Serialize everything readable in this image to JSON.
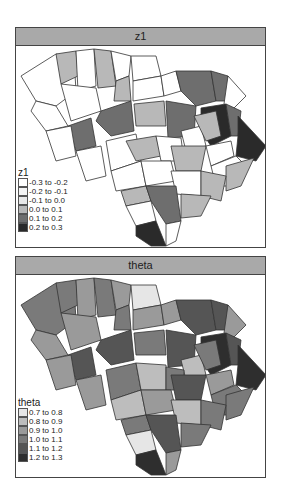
{
  "panels": [
    {
      "title": "z1",
      "legend": {
        "title": "z1",
        "items": [
          {
            "label": "-0.3 to -0.2",
            "color": "#ffffff"
          },
          {
            "label": "-0.2 to -0.1",
            "color": "#f4f4f4"
          },
          {
            "label": "-0.1 to 0.0",
            "color": "#e8e8e8"
          },
          {
            "label": "0.0 to 0.1",
            "color": "#b8b8b8"
          },
          {
            "label": "0.1 to 0.2",
            "color": "#6e6e6e"
          },
          {
            "label": "0.2 to 0.3",
            "color": "#2a2a2a"
          }
        ]
      }
    },
    {
      "title": "theta",
      "legend": {
        "title": "theta",
        "items": [
          {
            "label": "0.7 to 0.8",
            "color": "#e6e6e6"
          },
          {
            "label": "0.8 to 0.9",
            "color": "#bdbdbd"
          },
          {
            "label": "0.9 to 1.0",
            "color": "#9a9a9a"
          },
          {
            "label": "1.0 to 1.1",
            "color": "#7a7a7a"
          },
          {
            "label": "1.1 to 1.2",
            "color": "#555555"
          },
          {
            "label": "1.2 to 1.3",
            "color": "#2e2e2e"
          }
        ]
      }
    }
  ]
}
